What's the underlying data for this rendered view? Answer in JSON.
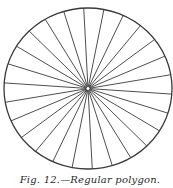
{
  "figure": {
    "caption": "Fig. 12.—Regular polygon.",
    "shape": "circle",
    "spoke_count": 26,
    "center": [
      88,
      88.5
    ],
    "radius_x": 84,
    "radius_y": 80.5,
    "angle_offset_deg": 4,
    "stroke_color": "#3a3a3a",
    "hub_radius": 2
  }
}
